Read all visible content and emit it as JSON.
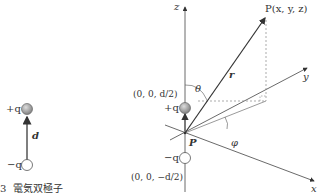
{
  "caption": {
    "number": "3",
    "title": "電気双極子"
  },
  "left_dipole": {
    "plus_label": "+q",
    "minus_label": "−q",
    "vector_label": "d"
  },
  "axes": {
    "z": "z",
    "y": "y",
    "x": "x"
  },
  "point": {
    "label": "P(x, y, z)"
  },
  "vector_r": "r",
  "angles": {
    "theta": "θ",
    "phi": "φ"
  },
  "origin_label": "P",
  "charges": {
    "plus": "+q",
    "minus": "−q"
  },
  "coords": {
    "top": "(0, 0, d/2)",
    "bottom": "(0, 0, −d/2)"
  },
  "colors": {
    "line": "#333333",
    "dashed": "#888888",
    "sphere": "#999999"
  }
}
